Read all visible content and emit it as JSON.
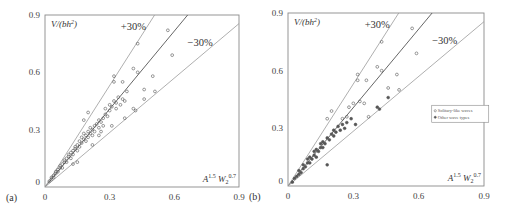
{
  "chart_data": [
    {
      "type": "scatter",
      "panel_label": "(a)",
      "title": "",
      "xlabel": "A^1.5 W2^0.7",
      "ylabel": "V/(bh^2)",
      "xlim": [
        0,
        0.9
      ],
      "ylim": [
        0,
        0.9
      ],
      "xticks": [
        "0",
        "0.3",
        "0.6",
        "0.9"
      ],
      "yticks": [
        "0",
        "0.3",
        "0.6",
        "0.9"
      ],
      "grid": false,
      "reference_lines": [
        {
          "name": "fit",
          "slope": 1.36,
          "label": ""
        },
        {
          "name": "+30%",
          "slope": 1.77,
          "label": "+30%"
        },
        {
          "name": "-30%",
          "slope": 0.95,
          "label": "-30%"
        }
      ],
      "series": [
        {
          "name": "data",
          "marker": "open-circle",
          "points": [
            [
              0.02,
              0.03
            ],
            [
              0.03,
              0.04
            ],
            [
              0.03,
              0.05
            ],
            [
              0.04,
              0.05
            ],
            [
              0.04,
              0.06
            ],
            [
              0.05,
              0.07
            ],
            [
              0.05,
              0.08
            ],
            [
              0.06,
              0.08
            ],
            [
              0.06,
              0.09
            ],
            [
              0.07,
              0.1
            ],
            [
              0.07,
              0.11
            ],
            [
              0.08,
              0.1
            ],
            [
              0.08,
              0.12
            ],
            [
              0.09,
              0.13
            ],
            [
              0.09,
              0.14
            ],
            [
              0.1,
              0.13
            ],
            [
              0.1,
              0.15
            ],
            [
              0.11,
              0.16
            ],
            [
              0.11,
              0.17
            ],
            [
              0.12,
              0.15
            ],
            [
              0.12,
              0.18
            ],
            [
              0.13,
              0.17
            ],
            [
              0.13,
              0.19
            ],
            [
              0.14,
              0.2
            ],
            [
              0.14,
              0.21
            ],
            [
              0.15,
              0.19
            ],
            [
              0.15,
              0.22
            ],
            [
              0.16,
              0.21
            ],
            [
              0.16,
              0.24
            ],
            [
              0.17,
              0.23
            ],
            [
              0.17,
              0.26
            ],
            [
              0.18,
              0.25
            ],
            [
              0.18,
              0.28
            ],
            [
              0.19,
              0.24
            ],
            [
              0.19,
              0.27
            ],
            [
              0.2,
              0.26
            ],
            [
              0.2,
              0.29
            ],
            [
              0.21,
              0.28
            ],
            [
              0.21,
              0.31
            ],
            [
              0.22,
              0.3
            ],
            [
              0.22,
              0.27
            ],
            [
              0.23,
              0.32
            ],
            [
              0.23,
              0.29
            ],
            [
              0.24,
              0.33
            ],
            [
              0.25,
              0.31
            ],
            [
              0.25,
              0.35
            ],
            [
              0.26,
              0.34
            ],
            [
              0.27,
              0.36
            ],
            [
              0.27,
              0.32
            ],
            [
              0.28,
              0.38
            ],
            [
              0.28,
              0.41
            ],
            [
              0.29,
              0.37
            ],
            [
              0.3,
              0.4
            ],
            [
              0.3,
              0.43
            ],
            [
              0.31,
              0.42
            ],
            [
              0.32,
              0.45
            ],
            [
              0.33,
              0.41
            ],
            [
              0.33,
              0.44
            ],
            [
              0.34,
              0.47
            ],
            [
              0.35,
              0.43
            ],
            [
              0.36,
              0.46
            ],
            [
              0.37,
              0.45
            ],
            [
              0.2,
              0.39
            ],
            [
              0.18,
              0.35
            ],
            [
              0.32,
              0.58
            ],
            [
              0.32,
              0.55
            ],
            [
              0.36,
              0.55
            ],
            [
              0.37,
              0.36
            ],
            [
              0.38,
              0.5
            ],
            [
              0.41,
              0.41
            ],
            [
              0.41,
              0.62
            ],
            [
              0.42,
              0.4
            ],
            [
              0.43,
              0.6
            ],
            [
              0.43,
              0.75
            ],
            [
              0.46,
              0.51
            ],
            [
              0.46,
              0.46
            ],
            [
              0.5,
              0.58
            ],
            [
              0.51,
              0.5
            ],
            [
              0.57,
              0.82
            ],
            [
              0.59,
              0.69
            ],
            [
              0.15,
              0.13
            ],
            [
              0.13,
              0.12
            ],
            [
              0.25,
              0.27
            ],
            [
              0.31,
              0.32
            ],
            [
              0.22,
              0.22
            ],
            [
              0.26,
              0.29
            ]
          ]
        }
      ]
    },
    {
      "type": "scatter",
      "panel_label": "(b)",
      "title": "",
      "xlabel": "A^1.5 W2^0.7",
      "ylabel": "V/(bh^2)",
      "xlim": [
        0,
        0.9
      ],
      "ylim": [
        0,
        0.9
      ],
      "xticks": [
        "0",
        "0.3",
        "0.6",
        "0.9"
      ],
      "yticks": [
        "0",
        "0.3",
        "0.6",
        "0.9"
      ],
      "grid": false,
      "legend": {
        "position": "center-right",
        "entries": [
          "Solitary-like waves",
          "Other wave types"
        ]
      },
      "reference_lines": [
        {
          "name": "fit",
          "slope": 1.36,
          "label": ""
        },
        {
          "name": "+30%",
          "slope": 1.77,
          "label": "+30%"
        },
        {
          "name": "-30%",
          "slope": 0.95,
          "label": "-30%"
        }
      ],
      "series": [
        {
          "name": "Solitary-like waves",
          "marker": "open-circle",
          "points": [
            [
              0.32,
              0.58
            ],
            [
              0.32,
              0.55
            ],
            [
              0.36,
              0.55
            ],
            [
              0.41,
              0.62
            ],
            [
              0.43,
              0.6
            ],
            [
              0.43,
              0.75
            ],
            [
              0.46,
              0.51
            ],
            [
              0.5,
              0.58
            ],
            [
              0.51,
              0.5
            ],
            [
              0.57,
              0.82
            ],
            [
              0.59,
              0.69
            ],
            [
              0.37,
              0.36
            ],
            [
              0.28,
              0.41
            ],
            [
              0.3,
              0.43
            ],
            [
              0.33,
              0.44
            ],
            [
              0.35,
              0.43
            ],
            [
              0.18,
              0.35
            ],
            [
              0.2,
              0.39
            ],
            [
              0.25,
              0.35
            ],
            [
              0.27,
              0.36
            ]
          ]
        },
        {
          "name": "Other wave types",
          "marker": "filled-circle",
          "points": [
            [
              0.02,
              0.02
            ],
            [
              0.03,
              0.04
            ],
            [
              0.04,
              0.05
            ],
            [
              0.05,
              0.06
            ],
            [
              0.05,
              0.08
            ],
            [
              0.06,
              0.07
            ],
            [
              0.07,
              0.09
            ],
            [
              0.07,
              0.11
            ],
            [
              0.08,
              0.1
            ],
            [
              0.09,
              0.12
            ],
            [
              0.09,
              0.14
            ],
            [
              0.1,
              0.12
            ],
            [
              0.1,
              0.15
            ],
            [
              0.11,
              0.14
            ],
            [
              0.12,
              0.16
            ],
            [
              0.12,
              0.18
            ],
            [
              0.13,
              0.15
            ],
            [
              0.13,
              0.19
            ],
            [
              0.14,
              0.18
            ],
            [
              0.15,
              0.2
            ],
            [
              0.15,
              0.22
            ],
            [
              0.16,
              0.2
            ],
            [
              0.16,
              0.23
            ],
            [
              0.17,
              0.22
            ],
            [
              0.18,
              0.25
            ],
            [
              0.18,
              0.11
            ],
            [
              0.19,
              0.24
            ],
            [
              0.2,
              0.27
            ],
            [
              0.21,
              0.26
            ],
            [
              0.21,
              0.29
            ],
            [
              0.22,
              0.28
            ],
            [
              0.23,
              0.31
            ],
            [
              0.24,
              0.29
            ],
            [
              0.25,
              0.32
            ],
            [
              0.26,
              0.3
            ],
            [
              0.27,
              0.33
            ],
            [
              0.29,
              0.35
            ],
            [
              0.31,
              0.32
            ],
            [
              0.41,
              0.41
            ],
            [
              0.42,
              0.4
            ],
            [
              0.46,
              0.46
            ]
          ]
        }
      ]
    }
  ],
  "annotations": {
    "plus30": "+30%",
    "minus30": "−30%",
    "ylabel_text": "V/(bh",
    "ylabel_sup": "2",
    "ylabel_close": ")",
    "xlabel_A": "A",
    "xlabel_A_sup": "1.5",
    "xlabel_W": "W",
    "xlabel_W_sub": "2",
    "xlabel_W_sup": "0.7"
  },
  "panels": [
    {
      "label": "(a)"
    },
    {
      "label": "(b)"
    }
  ],
  "legend_b": [
    "Solitary-like waves",
    "Other wave types"
  ]
}
